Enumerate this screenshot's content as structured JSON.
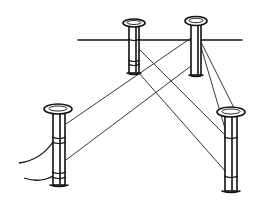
{
  "figure": {
    "colors": {
      "ink": "#111111",
      "background": "#ffffff"
    },
    "posts": [
      {
        "id": "left-post",
        "cx": 59,
        "top": 109,
        "bottom": 185,
        "width": 12
      },
      {
        "id": "back-left-post",
        "cx": 134,
        "top": 23,
        "bottom": 73,
        "width": 10
      },
      {
        "id": "back-right-post",
        "cx": 196,
        "top": 21,
        "bottom": 75,
        "width": 10
      },
      {
        "id": "front-right-post",
        "cx": 231,
        "top": 112,
        "bottom": 191,
        "width": 12
      }
    ],
    "baseline": {
      "x1": 78,
      "y1": 40,
      "x2": 242,
      "y2": 40
    }
  }
}
